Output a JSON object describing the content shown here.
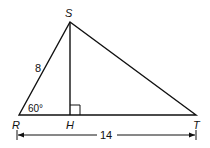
{
  "diagram": {
    "type": "geometry-triangle",
    "vertices": {
      "S": "S",
      "R": "R",
      "H": "H",
      "T": "T"
    },
    "side_RS_label": "8",
    "angle_R_label": "60°",
    "base_RT_label": "14",
    "right_angle_at": "H",
    "color": "#111111"
  }
}
